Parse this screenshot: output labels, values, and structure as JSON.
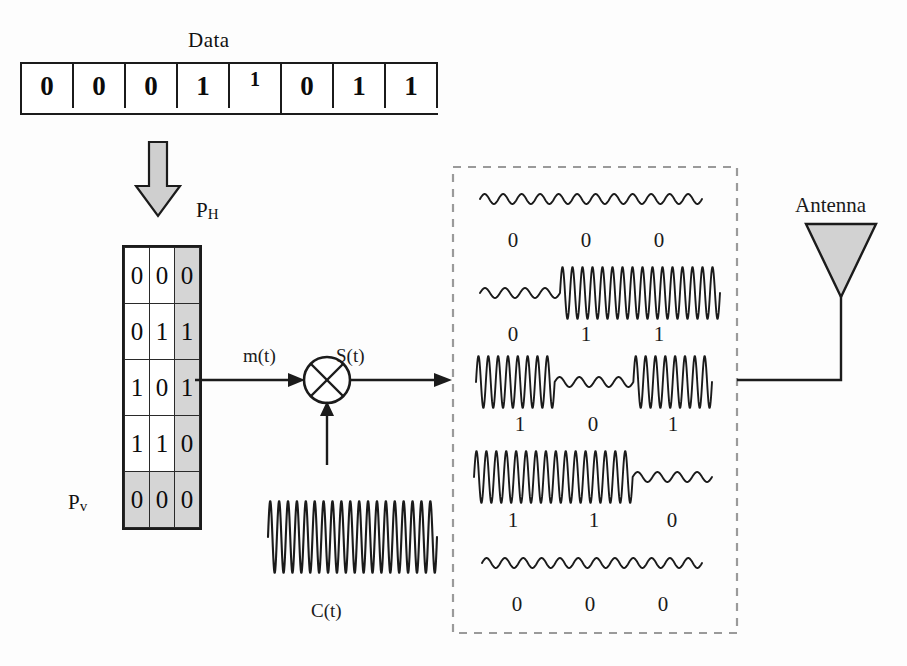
{
  "diagram": {
    "title_data": "Data",
    "data_bits": [
      "0",
      "0",
      "0",
      "1",
      "1",
      "0",
      "1",
      "1"
    ],
    "data_bit_raised_index": 4,
    "labels": {
      "ph": "P",
      "ph_sub": "H",
      "pv": "P",
      "pv_sub": "v",
      "mt": "m(t)",
      "st": "S(t)",
      "ct": "C(t)",
      "antenna": "Antenna"
    },
    "matrix": {
      "rows": [
        [
          "0",
          "0",
          "0"
        ],
        [
          "0",
          "1",
          "1"
        ],
        [
          "1",
          "0",
          "1"
        ],
        [
          "1",
          "1",
          "0"
        ],
        [
          "0",
          "0",
          "0"
        ]
      ],
      "shaded_column_index": 2,
      "shaded_row_index": 4
    },
    "waveform_rows": [
      {
        "bits": [
          "0",
          "0",
          "0"
        ]
      },
      {
        "bits": [
          "0",
          "1",
          "1"
        ]
      },
      {
        "bits": [
          "1",
          "0",
          "1"
        ]
      },
      {
        "bits": [
          "1",
          "1",
          "0"
        ]
      },
      {
        "bits": [
          "0",
          "0",
          "0"
        ]
      }
    ],
    "colors": {
      "ink": "#1a1a1a",
      "shade_gray": "#d5d5d5",
      "arrow_gray": "#cdcdcd",
      "dash_gray": "#9a9a9a",
      "background": "#fdfdfd"
    },
    "icons": {
      "down_arrow": "down-block-arrow-icon",
      "mixer": "multiplier-circle-x-icon",
      "antenna": "antenna-triangle-icon",
      "dashed_box": "dashed-group-box"
    }
  }
}
